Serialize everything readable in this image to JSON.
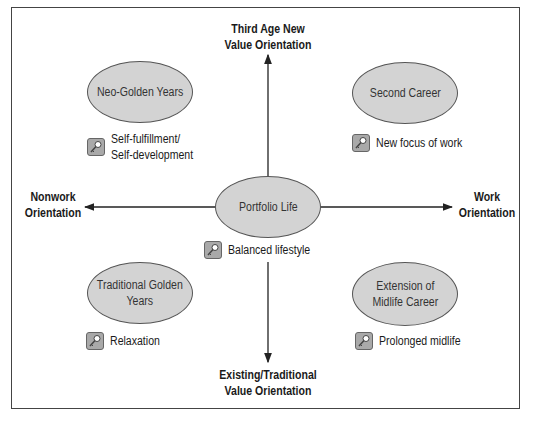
{
  "axes": {
    "top": "Third Age New\nValue Orientation",
    "bottom": "Existing/Traditional\nValue Orientation",
    "left": "Nonwork\nOrientation",
    "right": "Work\nOrientation"
  },
  "quadrants": {
    "top_left": {
      "title": "Neo-Golden Years",
      "note": "Self-fulfillment/\nSelf-development",
      "icon": "key-icon"
    },
    "top_right": {
      "title": "Second Career",
      "note": "New focus of work",
      "icon": "key-icon"
    },
    "center": {
      "title": "Portfolio Life",
      "note": "Balanced lifestyle",
      "icon": "key-icon"
    },
    "bottom_left": {
      "title": "Traditional Golden\nYears",
      "note": "Relaxation",
      "icon": "key-icon"
    },
    "bottom_right": {
      "title": "Extension of\nMidlife Career",
      "note": "Prolonged midlife",
      "icon": "key-icon"
    }
  },
  "colors": {
    "ellipse_fill": "#d3d3d3",
    "icon_fill": "#a9a9a9",
    "line": "#222222"
  }
}
